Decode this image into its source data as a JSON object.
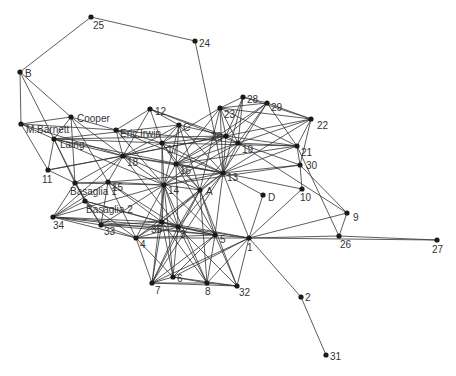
{
  "diagram": {
    "type": "network-graph",
    "nodes": [
      {
        "id": "25",
        "label": "25",
        "x": 91,
        "y": 17,
        "lx": 2,
        "ly": 12
      },
      {
        "id": "24",
        "label": "24",
        "x": 195,
        "y": 41,
        "lx": 4,
        "ly": 6
      },
      {
        "id": "B",
        "label": "B",
        "x": 20,
        "y": 72,
        "lx": 5,
        "ly": 5
      },
      {
        "id": "MBarnett",
        "label": "M.Barnett",
        "x": 21,
        "y": 124,
        "lx": 5,
        "ly": 9
      },
      {
        "id": "Cooper",
        "label": "Cooper",
        "x": 71,
        "y": 117,
        "lx": 6,
        "ly": 5
      },
      {
        "id": "Laing",
        "label": "Laing",
        "x": 54,
        "y": 139,
        "lx": 6,
        "ly": 9
      },
      {
        "id": "EricIrwin",
        "label": "Eric.Irwin",
        "x": 116,
        "y": 130,
        "lx": 4,
        "ly": 7
      },
      {
        "id": "12",
        "label": "12",
        "x": 150,
        "y": 109,
        "lx": 5,
        "ly": 6
      },
      {
        "id": "C",
        "label": "C",
        "x": 179,
        "y": 125,
        "lx": 4,
        "ly": 6
      },
      {
        "id": "17",
        "label": "17",
        "x": 162,
        "y": 143,
        "lx": 5,
        "ly": 10
      },
      {
        "id": "18",
        "label": "18",
        "x": 123,
        "y": 156,
        "lx": 4,
        "ly": 10
      },
      {
        "id": "11",
        "label": "11",
        "x": 48,
        "y": 170,
        "lx": -6,
        "ly": 13
      },
      {
        "id": "23",
        "label": "23",
        "x": 220,
        "y": 108,
        "lx": 4,
        "ly": 10
      },
      {
        "id": "28",
        "label": "28",
        "x": 243,
        "y": 97,
        "lx": 4,
        "ly": 6
      },
      {
        "id": "29",
        "label": "29",
        "x": 267,
        "y": 103,
        "lx": 4,
        "ly": 8
      },
      {
        "id": "22",
        "label": "22",
        "x": 311,
        "y": 119,
        "lx": 6,
        "ly": 10
      },
      {
        "id": "20",
        "label": "20",
        "x": 226,
        "y": 136,
        "lx": -15,
        "ly": 4
      },
      {
        "id": "19",
        "label": "19",
        "x": 238,
        "y": 143,
        "lx": 4,
        "ly": 10
      },
      {
        "id": "21",
        "label": "21",
        "x": 297,
        "y": 146,
        "lx": 4,
        "ly": 10
      },
      {
        "id": "30",
        "label": "30",
        "x": 300,
        "y": 165,
        "lx": 6,
        "ly": 4
      },
      {
        "id": "13",
        "label": "13",
        "x": 223,
        "y": 173,
        "lx": 4,
        "ly": 8
      },
      {
        "id": "16",
        "label": "16",
        "x": 176,
        "y": 164,
        "lx": 4,
        "ly": 10
      },
      {
        "id": "A",
        "label": "A",
        "x": 200,
        "y": 190,
        "lx": 6,
        "ly": 5
      },
      {
        "id": "D",
        "label": "D",
        "x": 263,
        "y": 195,
        "lx": 5,
        "ly": 6
      },
      {
        "id": "10",
        "label": "10",
        "x": 302,
        "y": 189,
        "lx": -2,
        "ly": 12
      },
      {
        "id": "9",
        "label": "9",
        "x": 347,
        "y": 213,
        "lx": 6,
        "ly": 8
      },
      {
        "id": "26",
        "label": "26",
        "x": 339,
        "y": 236,
        "lx": 1,
        "ly": 12
      },
      {
        "id": "15",
        "label": "15",
        "x": 108,
        "y": 182,
        "lx": 4,
        "ly": 9
      },
      {
        "id": "Basaglia1",
        "label": "Basaglia 1",
        "x": 75,
        "y": 183,
        "lx": -5,
        "ly": 12
      },
      {
        "id": "14",
        "label": "14",
        "x": 164,
        "y": 185,
        "lx": 4,
        "ly": 9
      },
      {
        "id": "Basaglia2",
        "label": "Basaglia 2",
        "x": 85,
        "y": 201,
        "lx": 1,
        "ly": 12
      },
      {
        "id": "34",
        "label": "34",
        "x": 53,
        "y": 217,
        "lx": 0,
        "ly": 12
      },
      {
        "id": "33",
        "label": "33",
        "x": 101,
        "y": 225,
        "lx": 3,
        "ly": 10
      },
      {
        "id": "35",
        "label": "35",
        "x": 162,
        "y": 222,
        "lx": -11,
        "ly": 11
      },
      {
        "id": "3",
        "label": "3",
        "x": 178,
        "y": 227,
        "lx": 2,
        "ly": 11
      },
      {
        "id": "4",
        "label": "4",
        "x": 136,
        "y": 238,
        "lx": 4,
        "ly": 10
      },
      {
        "id": "5",
        "label": "5",
        "x": 215,
        "y": 235,
        "lx": 5,
        "ly": 8
      },
      {
        "id": "1",
        "label": "1",
        "x": 249,
        "y": 238,
        "lx": -2,
        "ly": 13
      },
      {
        "id": "27",
        "label": "27",
        "x": 437,
        "y": 240,
        "lx": -5,
        "ly": 13
      },
      {
        "id": "7",
        "label": "7",
        "x": 152,
        "y": 283,
        "lx": 3,
        "ly": 11
      },
      {
        "id": "6",
        "label": "6",
        "x": 173,
        "y": 277,
        "lx": 4,
        "ly": 5
      },
      {
        "id": "8",
        "label": "8",
        "x": 207,
        "y": 283,
        "lx": -2,
        "ly": 12
      },
      {
        "id": "32",
        "label": "32",
        "x": 237,
        "y": 286,
        "lx": 2,
        "ly": 10
      },
      {
        "id": "2",
        "label": "2",
        "x": 301,
        "y": 297,
        "lx": 4,
        "ly": 4
      },
      {
        "id": "31",
        "label": "31",
        "x": 326,
        "y": 355,
        "lx": 4,
        "ly": 5
      }
    ],
    "edges": [
      [
        "25",
        "24"
      ],
      [
        "25",
        "B"
      ],
      [
        "24",
        "13"
      ],
      [
        "B",
        "MBarnett"
      ],
      [
        "B",
        "Cooper"
      ],
      [
        "B",
        "Laing"
      ],
      [
        "MBarnett",
        "Cooper"
      ],
      [
        "MBarnett",
        "Laing"
      ],
      [
        "MBarnett",
        "11"
      ],
      [
        "MBarnett",
        "EricIrwin"
      ],
      [
        "MBarnett",
        "18"
      ],
      [
        "Cooper",
        "Laing"
      ],
      [
        "Cooper",
        "Basaglia1"
      ],
      [
        "Cooper",
        "18"
      ],
      [
        "Cooper",
        "15"
      ],
      [
        "Cooper",
        "EricIrwin"
      ],
      [
        "Laing",
        "11"
      ],
      [
        "Laing",
        "Basaglia1"
      ],
      [
        "Laing",
        "18"
      ],
      [
        "Laing",
        "17"
      ],
      [
        "Laing",
        "C"
      ],
      [
        "Laing",
        "20"
      ],
      [
        "Laing",
        "Basaglia2"
      ],
      [
        "Laing",
        "13"
      ],
      [
        "Laing",
        "14"
      ],
      [
        "EricIrwin",
        "12"
      ],
      [
        "EricIrwin",
        "18"
      ],
      [
        "EricIrwin",
        "17"
      ],
      [
        "EricIrwin",
        "13"
      ],
      [
        "EricIrwin",
        "19"
      ],
      [
        "EricIrwin",
        "14"
      ],
      [
        "12",
        "18"
      ],
      [
        "12",
        "17"
      ],
      [
        "12",
        "C"
      ],
      [
        "12",
        "20"
      ],
      [
        "12",
        "19"
      ],
      [
        "C",
        "17"
      ],
      [
        "C",
        "16"
      ],
      [
        "C",
        "13"
      ],
      [
        "C",
        "20"
      ],
      [
        "C",
        "A"
      ],
      [
        "C",
        "18"
      ],
      [
        "C",
        "14"
      ],
      [
        "17",
        "18"
      ],
      [
        "17",
        "16"
      ],
      [
        "17",
        "14"
      ],
      [
        "17",
        "13"
      ],
      [
        "17",
        "20"
      ],
      [
        "17",
        "23"
      ],
      [
        "17",
        "35"
      ],
      [
        "17",
        "A"
      ],
      [
        "17",
        "21"
      ],
      [
        "18",
        "15"
      ],
      [
        "18",
        "Basaglia1"
      ],
      [
        "18",
        "34"
      ],
      [
        "18",
        "14"
      ],
      [
        "18",
        "13"
      ],
      [
        "18",
        "16"
      ],
      [
        "18",
        "3"
      ],
      [
        "18",
        "20"
      ],
      [
        "18",
        "11"
      ],
      [
        "18",
        "A"
      ],
      [
        "11",
        "Basaglia1"
      ],
      [
        "11",
        "20"
      ],
      [
        "23",
        "28"
      ],
      [
        "23",
        "29"
      ],
      [
        "23",
        "20"
      ],
      [
        "23",
        "19"
      ],
      [
        "23",
        "13"
      ],
      [
        "23",
        "22"
      ],
      [
        "23",
        "21"
      ],
      [
        "23",
        "16"
      ],
      [
        "23",
        "A"
      ],
      [
        "28",
        "29"
      ],
      [
        "28",
        "22"
      ],
      [
        "28",
        "20"
      ],
      [
        "28",
        "19"
      ],
      [
        "28",
        "13"
      ],
      [
        "29",
        "22"
      ],
      [
        "29",
        "21"
      ],
      [
        "29",
        "20"
      ],
      [
        "29",
        "19"
      ],
      [
        "29",
        "13"
      ],
      [
        "29",
        "16"
      ],
      [
        "22",
        "21"
      ],
      [
        "22",
        "30"
      ],
      [
        "22",
        "19"
      ],
      [
        "22",
        "20"
      ],
      [
        "22",
        "13"
      ],
      [
        "20",
        "19"
      ],
      [
        "20",
        "13"
      ],
      [
        "20",
        "21"
      ],
      [
        "20",
        "14"
      ],
      [
        "20",
        "16"
      ],
      [
        "19",
        "13"
      ],
      [
        "19",
        "21"
      ],
      [
        "19",
        "30"
      ],
      [
        "19",
        "A"
      ],
      [
        "19",
        "16"
      ],
      [
        "19",
        "9"
      ],
      [
        "19",
        "14"
      ],
      [
        "21",
        "30"
      ],
      [
        "21",
        "13"
      ],
      [
        "21",
        "26"
      ],
      [
        "21",
        "16"
      ],
      [
        "30",
        "13"
      ],
      [
        "30",
        "9"
      ],
      [
        "30",
        "10"
      ],
      [
        "30",
        "14"
      ],
      [
        "13",
        "16"
      ],
      [
        "13",
        "A"
      ],
      [
        "13",
        "14"
      ],
      [
        "13",
        "D"
      ],
      [
        "13",
        "10"
      ],
      [
        "13",
        "5"
      ],
      [
        "13",
        "1"
      ],
      [
        "13",
        "3"
      ],
      [
        "13",
        "35"
      ],
      [
        "13",
        "15"
      ],
      [
        "13",
        "7"
      ],
      [
        "16",
        "14"
      ],
      [
        "16",
        "A"
      ],
      [
        "16",
        "3"
      ],
      [
        "16",
        "5"
      ],
      [
        "A",
        "14"
      ],
      [
        "A",
        "35"
      ],
      [
        "A",
        "3"
      ],
      [
        "A",
        "4"
      ],
      [
        "A",
        "7"
      ],
      [
        "A",
        "5"
      ],
      [
        "A",
        "32"
      ],
      [
        "A",
        "8"
      ],
      [
        "D",
        "1"
      ],
      [
        "10",
        "1"
      ],
      [
        "9",
        "1"
      ],
      [
        "9",
        "26"
      ],
      [
        "26",
        "1"
      ],
      [
        "26",
        "27"
      ],
      [
        "1",
        "27"
      ],
      [
        "1",
        "2"
      ],
      [
        "2",
        "31"
      ],
      [
        "15",
        "14"
      ],
      [
        "15",
        "Basaglia1"
      ],
      [
        "15",
        "34"
      ],
      [
        "15",
        "33"
      ],
      [
        "15",
        "4"
      ],
      [
        "15",
        "35"
      ],
      [
        "15",
        "3"
      ],
      [
        "Basaglia1",
        "34"
      ],
      [
        "Basaglia1",
        "33"
      ],
      [
        "Basaglia1",
        "14"
      ],
      [
        "Basaglia1",
        "Basaglia2"
      ],
      [
        "14",
        "35"
      ],
      [
        "14",
        "3"
      ],
      [
        "14",
        "4"
      ],
      [
        "14",
        "34"
      ],
      [
        "14",
        "33"
      ],
      [
        "14",
        "5"
      ],
      [
        "14",
        "7"
      ],
      [
        "14",
        "6"
      ],
      [
        "14",
        "8"
      ],
      [
        "Basaglia2",
        "34"
      ],
      [
        "Basaglia2",
        "33"
      ],
      [
        "Basaglia2",
        "35"
      ],
      [
        "Basaglia2",
        "4"
      ],
      [
        "Basaglia2",
        "3"
      ],
      [
        "34",
        "33"
      ],
      [
        "34",
        "35"
      ],
      [
        "34",
        "4"
      ],
      [
        "34",
        "3"
      ],
      [
        "34",
        "5"
      ],
      [
        "33",
        "35"
      ],
      [
        "33",
        "4"
      ],
      [
        "33",
        "3"
      ],
      [
        "33",
        "5"
      ],
      [
        "35",
        "3"
      ],
      [
        "35",
        "4"
      ],
      [
        "35",
        "5"
      ],
      [
        "35",
        "7"
      ],
      [
        "35",
        "6"
      ],
      [
        "35",
        "8"
      ],
      [
        "35",
        "1"
      ],
      [
        "3",
        "4"
      ],
      [
        "3",
        "5"
      ],
      [
        "3",
        "1"
      ],
      [
        "3",
        "7"
      ],
      [
        "3",
        "6"
      ],
      [
        "3",
        "8"
      ],
      [
        "3",
        "32"
      ],
      [
        "4",
        "5"
      ],
      [
        "4",
        "1"
      ],
      [
        "4",
        "6"
      ],
      [
        "4",
        "7"
      ],
      [
        "5",
        "1"
      ],
      [
        "5",
        "7"
      ],
      [
        "5",
        "6"
      ],
      [
        "5",
        "8"
      ],
      [
        "5",
        "32"
      ],
      [
        "1",
        "7"
      ],
      [
        "1",
        "6"
      ],
      [
        "1",
        "8"
      ],
      [
        "1",
        "32"
      ],
      [
        "7",
        "6"
      ],
      [
        "7",
        "8"
      ],
      [
        "7",
        "32"
      ],
      [
        "6",
        "8"
      ],
      [
        "6",
        "32"
      ],
      [
        "8",
        "32"
      ]
    ]
  }
}
